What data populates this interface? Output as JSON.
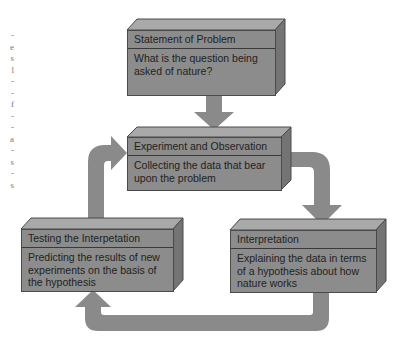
{
  "diagram": {
    "colors": {
      "box_front": "#8c8c8c",
      "box_top": "#a9a9a9",
      "box_side": "#747474",
      "arrow": "#8a8a8a",
      "text": "#222222"
    },
    "boxes": [
      {
        "id": "statement",
        "title": "Statement of Problem",
        "description": "What is the question being asked of nature?"
      },
      {
        "id": "experiment",
        "title": "Experiment and Observation",
        "description": "Collecting the data that bear upon the problem"
      },
      {
        "id": "testing",
        "title": "Testing the Interpetation",
        "description": "Predicting the results of new experiments on the basis of the hypothesis"
      },
      {
        "id": "interpretation",
        "title": "Interpretation",
        "description": "Explaining the data in terms of a hypothesis about how nature works"
      }
    ],
    "arrows": [
      {
        "from": "statement",
        "to": "experiment"
      },
      {
        "from": "experiment",
        "to": "interpretation"
      },
      {
        "from": "interpretation",
        "to": "testing"
      },
      {
        "from": "testing",
        "to": "experiment"
      }
    ],
    "margin_fragments": [
      "-",
      "e",
      "s",
      "l",
      "-",
      "-",
      "f",
      "-",
      "-",
      "a",
      "-",
      "s",
      "-",
      "s"
    ]
  }
}
